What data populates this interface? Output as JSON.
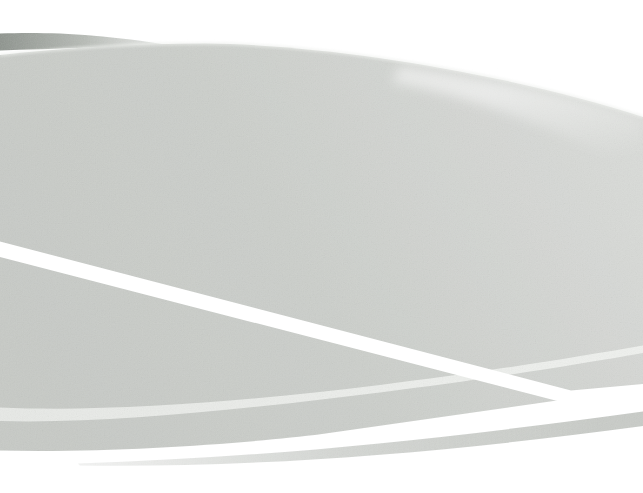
{
  "canvas": {
    "width": 643,
    "height": 493,
    "description": "Abstract light-gray swoosh wallpaper with sweeping white diagonal bands, a pale highlight stripe, a thin gray ribbon and a dark tapering sliver in the upper left. No text or interactive controls."
  },
  "colors": {
    "background": "#ffffff",
    "swoosh_dark": "#c7cac6",
    "swoosh_mid": "#cccfcb",
    "swoosh_light": "#d5d7d4",
    "swoosh_lightest": "#dadcd9",
    "sliver_dark": "#8e948e",
    "sliver_mid": "#b8bcb7",
    "sliver_tip": "#d6d9d5",
    "pale_stripe_start": "#e7e9e6",
    "pale_stripe_end": "#eff1ee",
    "ribbon": "#c9ccc8",
    "band_white": "#ffffff",
    "edge_glow": "#eef0ed",
    "sheen": "#ffffff"
  }
}
